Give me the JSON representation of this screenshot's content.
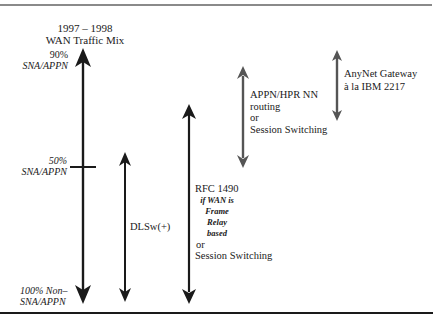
{
  "title": {
    "line1": "1997 – 1998",
    "line2": "WAN Traffic Mix"
  },
  "scale_labels": {
    "top_pct": "90%",
    "top_type": "SNA/APPN",
    "mid_pct": "50%",
    "mid_type": "SNA/APPN",
    "bottom_line1": "100% Non–",
    "bottom_line2": "SNA/APPN"
  },
  "arrows": [
    {
      "id": "traffic-mix-scale",
      "color": "#1a1a1a"
    },
    {
      "id": "dlsw",
      "label": "DLSw(+)",
      "color": "#1a1a1a"
    },
    {
      "id": "rfc1490",
      "color": "#1a1a1a",
      "label_line1": "RFC 1490",
      "qualifier_line1": "if WAN is",
      "qualifier_line2": "Frame Relay",
      "qualifier_line3": "based",
      "or": "or",
      "alt": "Session Switching"
    },
    {
      "id": "appn-hpr",
      "color": "#555555",
      "label_line1": "APPN/HPR NN",
      "label_line2": "routing",
      "or": "or",
      "alt": "Session Switching"
    },
    {
      "id": "anynet",
      "color": "#555555",
      "label_line1": "AnyNet Gateway",
      "label_line2": "à la IBM 2217"
    }
  ],
  "colors": {
    "primary_arrow": "#1a1a1a",
    "secondary_arrow": "#555555",
    "top_rule": "#8a8a8a",
    "bottom_rule": "#1a1a1a"
  }
}
